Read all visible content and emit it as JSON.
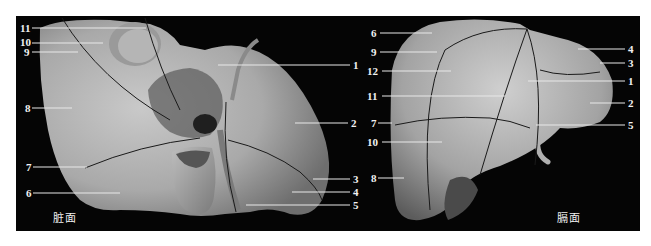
{
  "figure": {
    "background": "#050505",
    "leader_color": "#e8e8e8",
    "segment_line_color": "#1a1a1a"
  },
  "panels": [
    {
      "id": "visceral",
      "caption": "脏面",
      "labels": [
        {
          "text": "11",
          "side": "left",
          "y": 24
        },
        {
          "text": "10",
          "side": "left",
          "y": 42
        },
        {
          "text": "9",
          "side": "left",
          "y": 52
        },
        {
          "text": "8",
          "side": "left",
          "y": 108
        },
        {
          "text": "7",
          "side": "left",
          "y": 167
        },
        {
          "text": "6",
          "side": "left",
          "y": 193
        },
        {
          "text": "1",
          "side": "right",
          "y": 65
        },
        {
          "text": "2",
          "side": "right",
          "y": 123
        },
        {
          "text": "3",
          "side": "right",
          "y": 179
        },
        {
          "text": "4",
          "side": "right",
          "y": 192
        },
        {
          "text": "5",
          "side": "right",
          "y": 205
        }
      ]
    },
    {
      "id": "diaphragmatic",
      "caption": "膈面",
      "labels": [
        {
          "text": "6",
          "side": "left",
          "y": 33
        },
        {
          "text": "9",
          "side": "left",
          "y": 52
        },
        {
          "text": "12",
          "side": "left",
          "y": 71
        },
        {
          "text": "11",
          "side": "left",
          "y": 96
        },
        {
          "text": "7",
          "side": "left",
          "y": 123
        },
        {
          "text": "10",
          "side": "left",
          "y": 142
        },
        {
          "text": "8",
          "side": "left",
          "y": 178
        },
        {
          "text": "4",
          "side": "right",
          "y": 49
        },
        {
          "text": "3",
          "side": "right",
          "y": 63
        },
        {
          "text": "1",
          "side": "right",
          "y": 81
        },
        {
          "text": "2",
          "side": "right",
          "y": 103
        },
        {
          "text": "5",
          "side": "right",
          "y": 125
        }
      ]
    }
  ]
}
